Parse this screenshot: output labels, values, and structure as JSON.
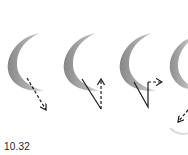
{
  "figure": {
    "label": "10.32",
    "panels": [
      {
        "id": 1,
        "stroke": "crescent",
        "arrow": "dashed-down-right"
      },
      {
        "id": 2,
        "stroke": "crescent",
        "arrow": "solid-down-then-dashed-up"
      },
      {
        "id": 3,
        "stroke": "crescent",
        "arrow": "solid-down-up-then-dashed-right"
      },
      {
        "id": 4,
        "stroke": "crescent-partial",
        "arrow": "dashed-down-left"
      }
    ],
    "colors": {
      "stroke": "#8a8a8a",
      "arrow": "#1a1a1a",
      "background": "#ffffff"
    }
  }
}
